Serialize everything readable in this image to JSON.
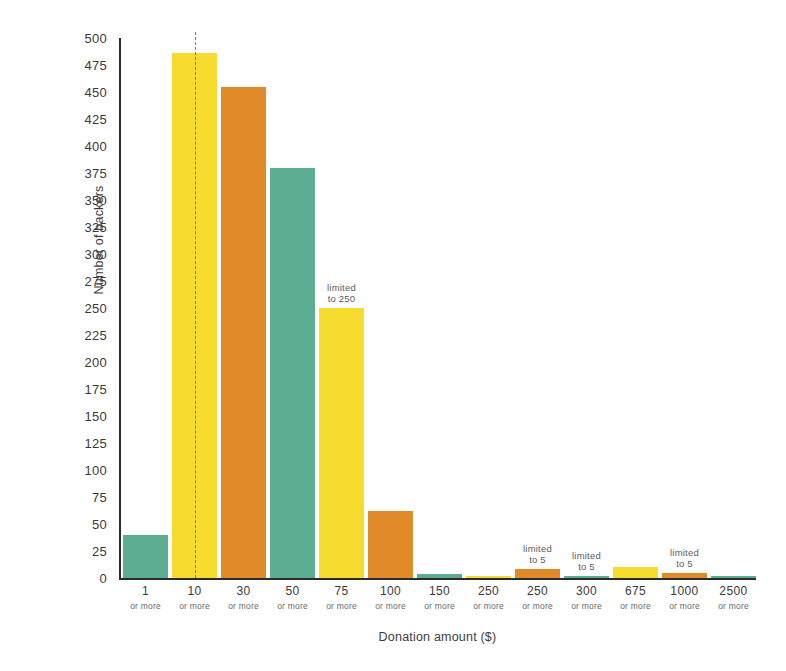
{
  "chart_data": {
    "type": "bar",
    "title": "",
    "xlabel": "Donation amount ($)",
    "ylabel": "Number of backers",
    "ylim": [
      0,
      500
    ],
    "ytick_step": 25,
    "yticks": [
      0,
      25,
      50,
      75,
      100,
      125,
      150,
      175,
      200,
      225,
      250,
      275,
      300,
      325,
      350,
      375,
      400,
      425,
      450,
      475,
      500
    ],
    "grid": false,
    "legend": "none",
    "category_sublabel": "or more",
    "categories": [
      "1",
      "10",
      "30",
      "50",
      "75",
      "100",
      "150",
      "250",
      "250",
      "300",
      "675",
      "1000",
      "2500"
    ],
    "values": [
      40,
      486,
      455,
      380,
      250,
      62,
      4,
      1,
      8,
      2,
      10,
      5,
      1
    ],
    "bar_colors": [
      "#5CAE93",
      "#F5DC2E",
      "#E08A2A",
      "#5CAE93",
      "#F5DC2E",
      "#E08A2A",
      "#5CAE93",
      "#F5DC2E",
      "#E08A2A",
      "#5CAE93",
      "#F5DC2E",
      "#E08A2A",
      "#5CAE93"
    ],
    "annotations": [
      {
        "category_index": 4,
        "text": "limited\nto 250"
      },
      {
        "category_index": 8,
        "text": "limited\nto 5"
      },
      {
        "category_index": 9,
        "text": "limited\nto 5"
      },
      {
        "category_index": 11,
        "text": "limited\nto 5"
      }
    ],
    "threshold_line": {
      "category_index": 1,
      "style": "dashed",
      "color": "#C8442C"
    }
  },
  "palette": {
    "teal": "#5CAE93",
    "yellow": "#F5DC2E",
    "orange": "#E08A2A",
    "axis": "#2B2B2B",
    "text": "#3A3A3A",
    "background": "#FFFFFF",
    "threshold": "#C8442C"
  }
}
